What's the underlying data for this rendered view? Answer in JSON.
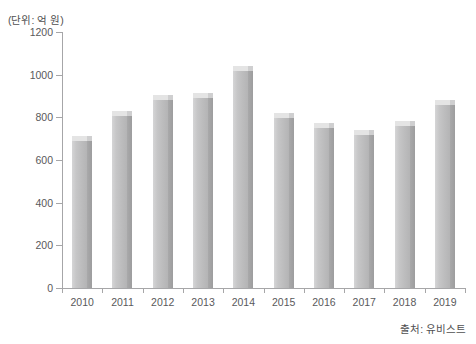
{
  "unit_note": "(단위: 억 원)",
  "source_note": "출처: 유비스트",
  "chart_data": {
    "type": "bar",
    "title": "",
    "xlabel": "",
    "ylabel": "",
    "unit": "(단위: 억 원)",
    "source": "출처: 유비스트",
    "categories": [
      "2010",
      "2011",
      "2012",
      "2013",
      "2014",
      "2015",
      "2016",
      "2017",
      "2018",
      "2019"
    ],
    "values": [
      690,
      805,
      880,
      890,
      1015,
      795,
      750,
      718,
      760,
      860
    ],
    "ylim": [
      0,
      1200
    ],
    "yticks": [
      0,
      200,
      400,
      600,
      800,
      1000,
      1200
    ],
    "ytick_labels": [
      "0",
      "200",
      "400",
      "600",
      "800",
      "1000",
      "1200"
    ],
    "grid": false,
    "legend": "none",
    "bar_style": "3d",
    "colors": {
      "bar_front": "#c6c6c7",
      "bar_side": "#a0a0a1",
      "bar_top": "#e4e4e4",
      "axis": "#a6a6a8",
      "text": "#59595b"
    }
  }
}
